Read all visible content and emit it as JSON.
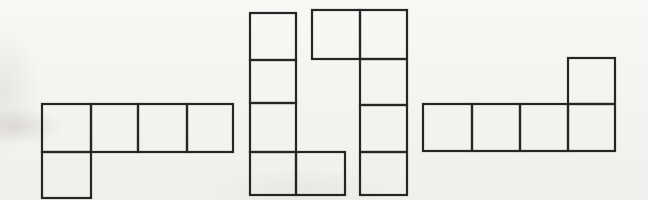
{
  "canvas": {
    "width": 648,
    "height": 200,
    "background_color": "#f5f4f0",
    "stroke_color": "#262626",
    "stroke_width": 2.2
  },
  "figure": {
    "kind": "pentomino-diagram",
    "shape_count": 4,
    "cells_per_shape": 5
  },
  "shapes": [
    {
      "id": "pentomino-shape-1",
      "description": "row of four squares with one square below the left end",
      "cells": [
        [
          42,
          104,
          49,
          48
        ],
        [
          91,
          104,
          47,
          48
        ],
        [
          138,
          104,
          49,
          48
        ],
        [
          187,
          104,
          46,
          48
        ],
        [
          42,
          152,
          49,
          46
        ]
      ]
    },
    {
      "id": "pentomino-shape-2",
      "description": "column of four squares with one square right of the bottom end",
      "cells": [
        [
          250,
          13,
          46,
          47
        ],
        [
          250,
          60,
          46,
          43
        ],
        [
          250,
          103,
          46,
          49
        ],
        [
          250,
          152,
          46,
          43
        ],
        [
          296,
          152,
          49,
          43
        ]
      ]
    },
    {
      "id": "pentomino-shape-3",
      "description": "column of four squares with one square left of the top end",
      "cells": [
        [
          312,
          10,
          48,
          49
        ],
        [
          360,
          10,
          47,
          49
        ],
        [
          360,
          59,
          47,
          46
        ],
        [
          360,
          105,
          47,
          47
        ],
        [
          360,
          152,
          47,
          43
        ]
      ]
    },
    {
      "id": "pentomino-shape-4",
      "description": "row of four squares with one square above the right end",
      "cells": [
        [
          423,
          104,
          49,
          47
        ],
        [
          472,
          104,
          48,
          47
        ],
        [
          520,
          104,
          48,
          47
        ],
        [
          568,
          104,
          47,
          47
        ],
        [
          568,
          58,
          47,
          46
        ]
      ]
    }
  ]
}
